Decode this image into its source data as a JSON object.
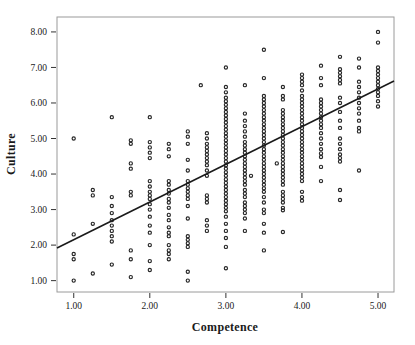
{
  "figure": {
    "background": "#ffffff",
    "frame_color": "#9a9a9a",
    "tick_color": "#333333",
    "marker_color": "#262626",
    "fit_line_color": "#1a1a1a"
  },
  "chart_data": {
    "type": "scatter",
    "title": "",
    "xlabel": "Competence",
    "ylabel": "Culture",
    "grid": false,
    "legend": "none",
    "marker": "open-circle",
    "xlim": [
      0.78,
      5.21
    ],
    "ylim": [
      0.68,
      8.42
    ],
    "x_tick_values": [
      1,
      2,
      3,
      4,
      5
    ],
    "x_tick_labels": [
      "1.00",
      "2.00",
      "3.00",
      "4.00",
      "5.00"
    ],
    "y_tick_values": [
      1,
      2,
      3,
      4,
      5,
      6,
      7,
      8
    ],
    "y_tick_labels": [
      "1.00",
      "2.00",
      "3.00",
      "4.00",
      "5.00",
      "6.00",
      "7.00",
      "8.00"
    ],
    "fit_line": {
      "x1": 0.78,
      "y1": 1.92,
      "x2": 5.21,
      "y2": 6.62
    },
    "columns": [
      {
        "x": 1.0,
        "ys": [
          5.0,
          2.3,
          1.75,
          1.6,
          1.0
        ]
      },
      {
        "x": 1.25,
        "ys": [
          3.55,
          3.4,
          2.6,
          1.2
        ]
      },
      {
        "x": 1.5,
        "ys": [
          5.6,
          3.35,
          3.1,
          2.9,
          2.7,
          2.55,
          2.4,
          2.25,
          2.1,
          1.45
        ]
      },
      {
        "x": 1.75,
        "ys": [
          4.95,
          4.85,
          4.3,
          4.15,
          3.5,
          3.4,
          1.85,
          1.6,
          1.1
        ]
      },
      {
        "x": 2.0,
        "ys": [
          5.6,
          4.9,
          4.75,
          4.6,
          4.45,
          3.8,
          3.65,
          3.5,
          3.4,
          3.3,
          3.15,
          3.0,
          2.8,
          2.55,
          2.35,
          2.0,
          1.55,
          1.3
        ]
      },
      {
        "x": 2.25,
        "ys": [
          4.85,
          4.7,
          4.5,
          3.8,
          3.7,
          3.55,
          3.45,
          3.3,
          3.2,
          3.05,
          2.85,
          2.7,
          2.5,
          2.35,
          2.25,
          2.0,
          1.85,
          1.75,
          1.6
        ]
      },
      {
        "x": 2.5,
        "ys": [
          5.2,
          5.05,
          4.85,
          4.4,
          4.1,
          3.8,
          3.7,
          3.6,
          3.5,
          3.4,
          3.3,
          3.1,
          2.75,
          2.25,
          2.15,
          2.05,
          1.95,
          1.25,
          1.0
        ]
      },
      {
        "x": 2.67,
        "ys": [
          6.5
        ]
      },
      {
        "x": 2.75,
        "ys": [
          5.15,
          5.0,
          4.85,
          4.75,
          4.65,
          4.55,
          4.45,
          4.35,
          4.25,
          4.1,
          3.95,
          3.4,
          3.3,
          3.2,
          2.7,
          2.55,
          2.4
        ]
      },
      {
        "x": 3.0,
        "ys": [
          7.0,
          6.45,
          6.3,
          6.15,
          6.05,
          5.95,
          5.85,
          5.75,
          5.65,
          5.55,
          5.45,
          5.35,
          5.25,
          5.15,
          5.05,
          4.95,
          4.85,
          4.75,
          4.65,
          4.55,
          4.45,
          4.35,
          4.25,
          4.15,
          4.05,
          3.95,
          3.85,
          3.75,
          3.65,
          3.55,
          3.45,
          3.35,
          3.25,
          3.15,
          3.05,
          2.95,
          2.8,
          2.6,
          2.4,
          2.2,
          1.95,
          1.35
        ]
      },
      {
        "x": 3.25,
        "ys": [
          6.5,
          5.7,
          5.5,
          5.35,
          5.2,
          5.05,
          4.9,
          4.8,
          4.7,
          4.6,
          4.5,
          4.4,
          4.3,
          4.2,
          4.1,
          4.0,
          3.9,
          3.8,
          3.7,
          3.55,
          3.45,
          3.35,
          3.2,
          3.1,
          3.0,
          2.9,
          2.75,
          2.4
        ]
      },
      {
        "x": 3.33,
        "ys": [
          3.95
        ]
      },
      {
        "x": 3.5,
        "ys": [
          7.5,
          6.7,
          6.2,
          6.1,
          6.0,
          5.9,
          5.8,
          5.7,
          5.6,
          5.5,
          5.4,
          5.3,
          5.2,
          5.1,
          5.0,
          4.9,
          4.8,
          4.7,
          4.6,
          4.5,
          4.4,
          4.3,
          4.2,
          4.1,
          4.0,
          3.9,
          3.8,
          3.7,
          3.6,
          3.5,
          3.35,
          3.2,
          3.0,
          2.9,
          2.6,
          2.35,
          1.85
        ]
      },
      {
        "x": 3.67,
        "ys": [
          4.3
        ]
      },
      {
        "x": 3.75,
        "ys": [
          6.45,
          6.2,
          6.1,
          5.8,
          5.7,
          5.6,
          5.5,
          5.4,
          5.3,
          5.2,
          5.1,
          5.0,
          4.9,
          4.8,
          4.7,
          4.6,
          4.5,
          4.4,
          4.3,
          4.2,
          4.1,
          4.0,
          3.9,
          3.8,
          3.7,
          3.5,
          3.4,
          3.3,
          3.2,
          3.05,
          2.98,
          2.37
        ]
      },
      {
        "x": 4.0,
        "ys": [
          6.8,
          6.7,
          6.6,
          6.5,
          6.35,
          6.2,
          6.1,
          6.0,
          5.9,
          5.8,
          5.7,
          5.6,
          5.5,
          5.4,
          5.3,
          5.2,
          5.1,
          5.0,
          4.9,
          4.8,
          4.7,
          4.6,
          4.5,
          4.4,
          4.3,
          4.2,
          4.1,
          4.0,
          3.9,
          3.8,
          3.5,
          3.35,
          3.25
        ]
      },
      {
        "x": 4.25,
        "ys": [
          7.05,
          6.7,
          6.5,
          6.1,
          6.0,
          5.9,
          5.8,
          5.7,
          5.6,
          5.5,
          5.4,
          5.3,
          5.15,
          5.0,
          4.85,
          4.7,
          4.58,
          4.48,
          4.2,
          3.8
        ]
      },
      {
        "x": 4.5,
        "ys": [
          7.3,
          6.95,
          6.85,
          6.75,
          6.65,
          6.55,
          6.15,
          6.0,
          5.75,
          5.5,
          5.3,
          5.0,
          4.85,
          4.7,
          4.55,
          4.45,
          4.35,
          3.55,
          3.27
        ]
      },
      {
        "x": 4.75,
        "ys": [
          7.25,
          7.0,
          6.6,
          6.45,
          6.3,
          6.15,
          6.0,
          5.85,
          5.7,
          5.5,
          5.3,
          5.2,
          4.1
        ]
      },
      {
        "x": 5.0,
        "ys": [
          8.0,
          7.7,
          7.0,
          6.9,
          6.8,
          6.7,
          6.6,
          6.5,
          6.4,
          6.3,
          6.2,
          6.05,
          5.9
        ]
      }
    ]
  }
}
